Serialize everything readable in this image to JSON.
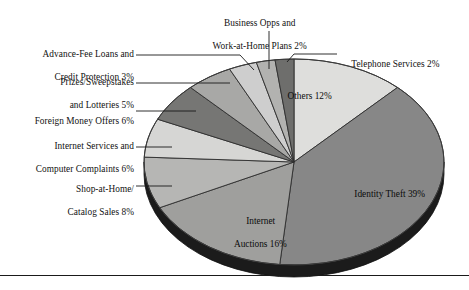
{
  "figure": {
    "background_color": "#ffffff",
    "has_bottom_rule": true,
    "rule_color": "#1a1a1a"
  },
  "chart_data": {
    "type": "pie",
    "title": "",
    "subtitle": "",
    "xlabel": "",
    "ylabel": "",
    "legend_position": "none",
    "grid": false,
    "total_percent": 99,
    "start_angle_deg": 0,
    "direction": "clockwise",
    "three_d": true,
    "categories": [
      "Others",
      "Identity Theft",
      "Internet Auctions",
      "Shop-at-Home/ Catalog Sales",
      "Internet Services and Computer Complaints",
      "Foreign Money Offers",
      "Prizes/Sweepstakes and Lotteries",
      "Advance-Fee Loans and Credit Protection",
      "Business Opps and Work-at-Home Plans",
      "Telephone Services"
    ],
    "values": [
      12,
      39,
      16,
      8,
      6,
      6,
      5,
      3,
      2,
      2
    ],
    "value_suffix": "%",
    "slices": [
      {
        "name": "Others",
        "value": 12,
        "label": "Others 12%",
        "color": "#dededc",
        "label_placement": "inside"
      },
      {
        "name": "Identity Theft",
        "value": 39,
        "label": "Identity Theft 39%",
        "color": "#878787",
        "label_placement": "inside"
      },
      {
        "name": "Internet Auctions",
        "value": 16,
        "label": "Internet\nAuctions 16%",
        "color": "#9f9f9d",
        "label_placement": "inside"
      },
      {
        "name": "Shop-at-Home/ Catalog Sales",
        "value": 8,
        "label": "Shop-at-Home/\nCatalog Sales 8%",
        "color": "#b6b6b4",
        "label_placement": "leader-left"
      },
      {
        "name": "Internet Services and Computer Complaints",
        "value": 6,
        "label": "Internet Services and\nComputer Complaints 6%",
        "color": "#d6d6d4",
        "label_placement": "leader-left"
      },
      {
        "name": "Foreign Money Offers",
        "value": 6,
        "label": "Foreign Money Offers 6%",
        "color": "#767674",
        "label_placement": "leader-left"
      },
      {
        "name": "Prizes/Sweepstakes and Lotteries",
        "value": 5,
        "label": "Prizes/Sweepstakes\nand Lotteries 5%",
        "color": "#a8a8a6",
        "label_placement": "leader-left"
      },
      {
        "name": "Advance-Fee Loans and Credit Protection",
        "value": 3,
        "label": "Advance-Fee Loans and\nCredit Protection 3%",
        "color": "#cecece",
        "label_placement": "leader-left"
      },
      {
        "name": "Business Opps and Work-at-Home Plans",
        "value": 2,
        "label": "Business Opps and\nWork-at-Home Plans 2%",
        "color": "#b2b2b0",
        "label_placement": "leader-top"
      },
      {
        "name": "Telephone Services",
        "value": 2,
        "label": "Telephone Services 2%",
        "color": "#6e6e6c",
        "label_placement": "leader-right"
      }
    ]
  },
  "labels": {
    "business_opps_line1": "Business Opps and",
    "business_opps_line2": "Work-at-Home Plans 2%",
    "telephone": "Telephone Services 2%",
    "advance_fee_line1": "Advance-Fee Loans and",
    "advance_fee_line2": "Credit Protection 3%",
    "prizes_line1": "Prizes/Sweepstakes",
    "prizes_line2": "and Lotteries 5%",
    "foreign_money": "Foreign Money Offers 6%",
    "internet_services_line1": "Internet Services and",
    "internet_services_line2": "Computer Complaints 6%",
    "shop_at_home_line1": "Shop-at-Home/",
    "shop_at_home_line2": "Catalog Sales 8%",
    "internet_auctions_line1": "Internet",
    "internet_auctions_line2": "Auctions 16%",
    "identity_theft": "Identity Theft 39%",
    "others": "Others 12%"
  },
  "colors": {
    "slice_dark": "#6e6e6c",
    "slice_mid": "#878787",
    "slice_light": "#dededc",
    "edge": "#2a2a2a",
    "depth": "#161616",
    "leader_line": "#1a1a1a"
  }
}
